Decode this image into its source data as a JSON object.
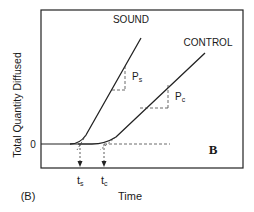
{
  "figure": {
    "panel_label": "(B)",
    "panel_letter": "B",
    "y_axis_label": "Total Quantity Diffused",
    "x_axis_label": "Time",
    "y_zero_label": "0",
    "curves": [
      {
        "name": "SOUND",
        "slope_label": "P",
        "slope_subscript": "s",
        "lag_label": "t",
        "lag_subscript": "s"
      },
      {
        "name": "CONTROL",
        "slope_label": "P",
        "slope_subscript": "c",
        "lag_label": "t",
        "lag_subscript": "c"
      }
    ]
  }
}
